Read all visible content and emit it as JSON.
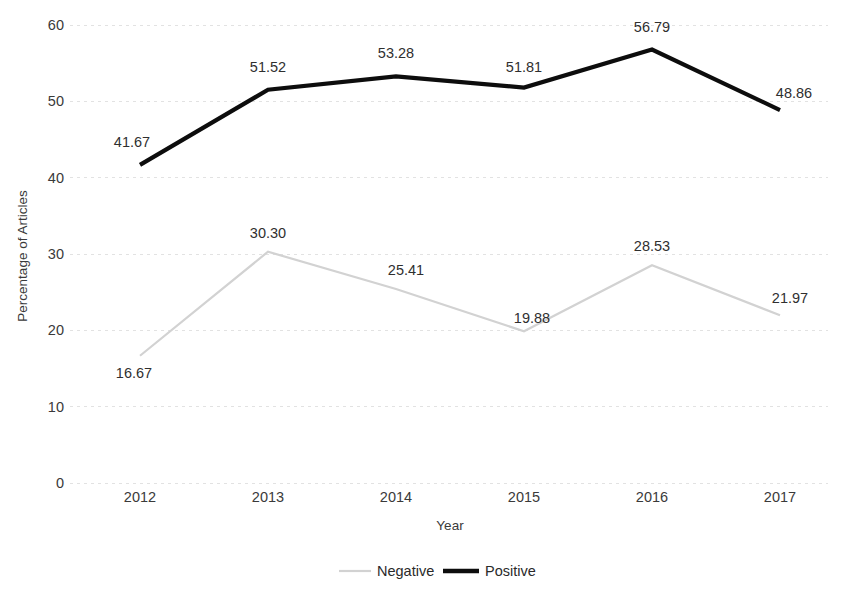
{
  "chart_data": {
    "type": "line",
    "title": "",
    "xlabel": "Year",
    "ylabel": "Percentage of Articles",
    "categories": [
      "2012",
      "2013",
      "2014",
      "2015",
      "2016",
      "2017"
    ],
    "series": [
      {
        "name": "Negative",
        "color": "#d2d2d2",
        "values": [
          16.67,
          30.3,
          25.41,
          19.88,
          28.53,
          21.97
        ],
        "labels": [
          "16.67",
          "30.30",
          "25.41",
          "19.88",
          "28.53",
          "21.97"
        ]
      },
      {
        "name": "Positive",
        "color": "#0d0d0d",
        "values": [
          41.67,
          51.52,
          53.28,
          51.81,
          56.79,
          48.86
        ],
        "labels": [
          "41.67",
          "51.52",
          "53.28",
          "51.81",
          "56.79",
          "48.86"
        ]
      }
    ],
    "ylim": [
      0,
      60
    ],
    "yticks": [
      0,
      10,
      20,
      30,
      40,
      50,
      60
    ],
    "ytick_labels": [
      "0",
      "10",
      "20",
      "30",
      "40",
      "50",
      "60"
    ],
    "grid": true,
    "grid_axis": "y",
    "legend_position": "bottom",
    "legend_entries": [
      "Negative",
      "Positive"
    ]
  }
}
